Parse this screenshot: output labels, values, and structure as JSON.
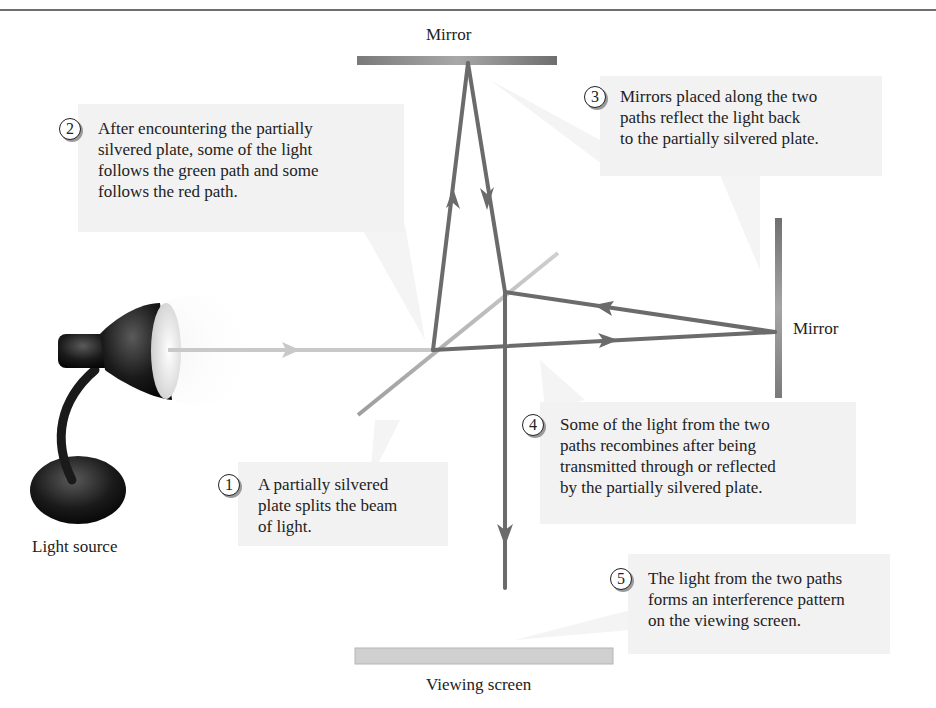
{
  "figure": {
    "colors": {
      "beam": "#6b6b6b",
      "incoming_beam": "#c9c9c9",
      "plate": "#b4b4b4",
      "mirror": "#8a8a8a",
      "callout_bg": "#f2f2f2",
      "rule": "#6e6e6e"
    }
  },
  "labels": {
    "top_mirror": "Mirror",
    "right_mirror": "Mirror",
    "light_source": "Light source",
    "viewing_screen": "Viewing screen"
  },
  "callouts": [
    {
      "number": "1",
      "text": "A partially silvered\nplate splits the beam\nof light."
    },
    {
      "number": "2",
      "text": "After encountering the partially\nsilvered plate, some of the light\nfollows the green path and some\nfollows the red path."
    },
    {
      "number": "3",
      "text": "Mirrors placed along the two\npaths reflect the light back\nto the partially silvered plate."
    },
    {
      "number": "4",
      "text": "Some of the light from the two\npaths recombines after being\ntransmitted through or reflected\nby the partially silvered plate."
    },
    {
      "number": "5",
      "text": "The light from the two paths\nforms an interference pattern\non the viewing screen."
    }
  ]
}
